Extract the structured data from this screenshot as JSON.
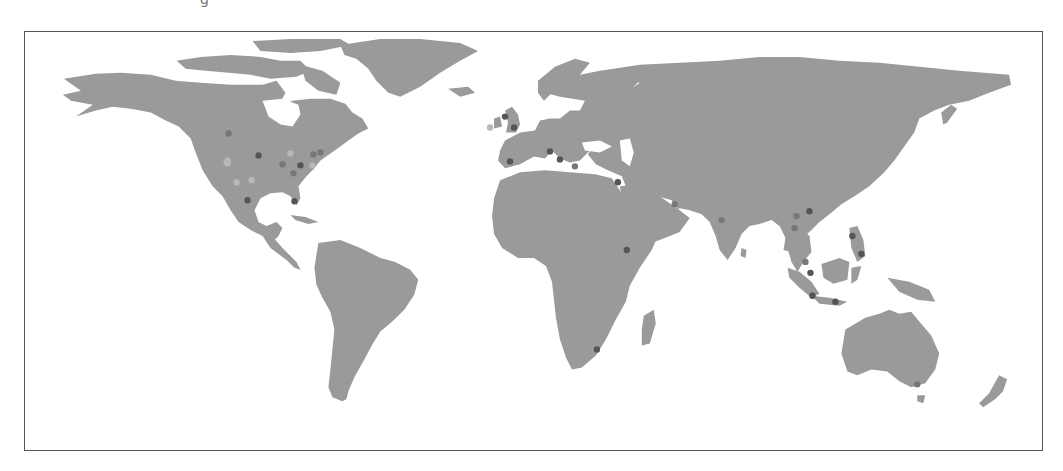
{
  "map": {
    "title_fragment": "g",
    "projection": "equirectangular",
    "colors": {
      "land": "#9a9a9a",
      "water": "#ffffff",
      "border": "#555555",
      "dot_dark": "#555555",
      "dot_mid": "#777777",
      "dot_light": "#b8b8b8"
    },
    "points": [
      {
        "region": "Canada - Manitoba",
        "x": 228,
        "y": 133,
        "shade": "mid"
      },
      {
        "region": "US - Montana",
        "x": 227,
        "y": 160,
        "shade": "light"
      },
      {
        "region": "US - Utah",
        "x": 227,
        "y": 163,
        "shade": "light"
      },
      {
        "region": "US - Colorado",
        "x": 226,
        "y": 162,
        "shade": "light"
      },
      {
        "region": "US - Minnesota",
        "x": 258,
        "y": 155,
        "shade": "dark"
      },
      {
        "region": "US - Illinois",
        "x": 282,
        "y": 164,
        "shade": "mid"
      },
      {
        "region": "US - Michigan",
        "x": 290,
        "y": 153,
        "shade": "light"
      },
      {
        "region": "US - Ohio",
        "x": 300,
        "y": 165,
        "shade": "dark"
      },
      {
        "region": "US - New York",
        "x": 313,
        "y": 154,
        "shade": "mid"
      },
      {
        "region": "US - Boston",
        "x": 320,
        "y": 152,
        "shade": "mid"
      },
      {
        "region": "US - Virginia",
        "x": 312,
        "y": 165,
        "shade": "light"
      },
      {
        "region": "US - Tennessee",
        "x": 293,
        "y": 173,
        "shade": "mid"
      },
      {
        "region": "US - Oklahoma",
        "x": 251,
        "y": 180,
        "shade": "light"
      },
      {
        "region": "US - Arizona",
        "x": 236,
        "y": 182,
        "shade": "light"
      },
      {
        "region": "US - Texas",
        "x": 247,
        "y": 200,
        "shade": "dark"
      },
      {
        "region": "US - Florida",
        "x": 294,
        "y": 201,
        "shade": "dark"
      },
      {
        "region": "Ireland",
        "x": 490,
        "y": 127,
        "shade": "light"
      },
      {
        "region": "UK - Scotland",
        "x": 505,
        "y": 116,
        "shade": "dark"
      },
      {
        "region": "UK - England",
        "x": 514,
        "y": 127,
        "shade": "dark"
      },
      {
        "region": "Spain",
        "x": 510,
        "y": 161,
        "shade": "dark"
      },
      {
        "region": "Italy - North",
        "x": 550,
        "y": 151,
        "shade": "dark"
      },
      {
        "region": "Italy - South",
        "x": 560,
        "y": 159,
        "shade": "dark"
      },
      {
        "region": "Greece",
        "x": 575,
        "y": 166,
        "shade": "mid"
      },
      {
        "region": "Israel",
        "x": 618,
        "y": 182,
        "shade": "dark"
      },
      {
        "region": "UAE",
        "x": 675,
        "y": 204,
        "shade": "mid"
      },
      {
        "region": "Ethiopia",
        "x": 627,
        "y": 250,
        "shade": "dark"
      },
      {
        "region": "South Africa",
        "x": 597,
        "y": 350,
        "shade": "dark"
      },
      {
        "region": "India - Mumbai",
        "x": 722,
        "y": 220,
        "shade": "mid"
      },
      {
        "region": "China - Guangzhou",
        "x": 810,
        "y": 211,
        "shade": "dark"
      },
      {
        "region": "Vietnam - Hanoi",
        "x": 797,
        "y": 216,
        "shade": "mid"
      },
      {
        "region": "Thailand",
        "x": 795,
        "y": 228,
        "shade": "mid"
      },
      {
        "region": "Philippines - Luzon",
        "x": 853,
        "y": 236,
        "shade": "dark"
      },
      {
        "region": "Philippines - Mindanao",
        "x": 862,
        "y": 254,
        "shade": "dark"
      },
      {
        "region": "Malaysia",
        "x": 806,
        "y": 262,
        "shade": "mid"
      },
      {
        "region": "Singapore",
        "x": 811,
        "y": 273,
        "shade": "dark"
      },
      {
        "region": "Indonesia - Jakarta",
        "x": 813,
        "y": 296,
        "shade": "dark"
      },
      {
        "region": "Indonesia - Java East",
        "x": 836,
        "y": 302,
        "shade": "dark"
      },
      {
        "region": "Australia - Melbourne",
        "x": 918,
        "y": 385,
        "shade": "mid"
      }
    ]
  }
}
